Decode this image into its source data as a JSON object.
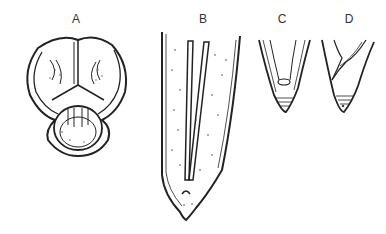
{
  "figure": {
    "panels": [
      {
        "id": "A",
        "label": "A",
        "description": "head, en face view"
      },
      {
        "id": "B",
        "label": "B",
        "description": "tail, lateral view with spicules"
      },
      {
        "id": "C",
        "label": "C",
        "description": "tail tip"
      },
      {
        "id": "D",
        "label": "D",
        "description": "tail tip"
      }
    ],
    "colors": {
      "ink": "#222222",
      "background": "#ffffff"
    }
  }
}
